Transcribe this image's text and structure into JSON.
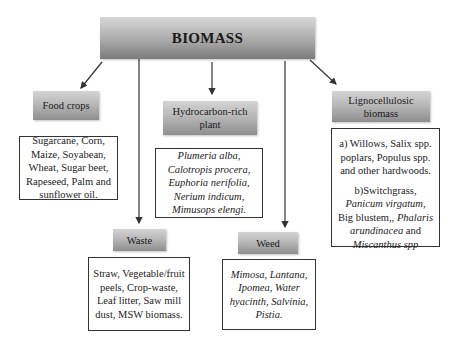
{
  "title": "BIOMASS",
  "categories": [
    {
      "id": "food-crops",
      "label": "Food crops",
      "items": "Sugarcane, Corn, Maize, Soyabean, Wheat, Sugar beet, Rapeseed, Palm and sunflower oil."
    },
    {
      "id": "hydrocarbon",
      "label": "Hydrocarbon-rich plant",
      "items": "Plumeria alba, Calotropis procera, Euphoria nerifolia, Nerium indicum, Mimusops elengi."
    },
    {
      "id": "lignocellulosic",
      "label": "Lignocellulosic biomass",
      "items_a": "a) Willows, Salix spp. poplars, Populus spp. and other hardwoods.",
      "items_b_1": "b)Switchgrass,",
      "items_b_2": "Panicum virgatum",
      "items_b_3": "Big blustem,,",
      "items_b_4": "Phalaris arundinacea",
      "items_b_5": "and",
      "items_b_6": "Miscanthus spp"
    },
    {
      "id": "waste",
      "label": "Waste",
      "items": "Straw, Vegetable/fruit peels, Crop-waste, Leaf litter, Saw mill dust, MSW biomass."
    },
    {
      "id": "weed",
      "label": "Weed",
      "items": "Mimosa, Lantana, Ipomea, Water hyacinth, Salvinia, Pistia."
    }
  ],
  "colors": {
    "header_gradient_top": "#d4d4d4",
    "header_gradient_bottom": "#8e8e8e",
    "line": "#333333"
  }
}
